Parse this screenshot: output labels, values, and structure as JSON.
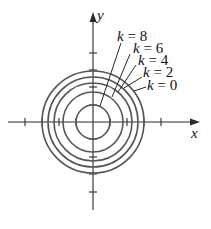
{
  "diagram": {
    "type": "level-curves",
    "origin_px": [
      93,
      122
    ],
    "unit_px": 17,
    "axes": {
      "x_label": "x",
      "y_label": "y",
      "x_ticks": [
        -4,
        -3,
        -2,
        -1,
        1,
        2,
        3,
        4
      ],
      "y_ticks": [
        -4,
        -3,
        -2,
        -1,
        1,
        2,
        3,
        4
      ]
    },
    "curves": [
      {
        "k": 8,
        "radius": 1.0
      },
      {
        "k": 6,
        "radius": 1.732
      },
      {
        "k": 4,
        "radius": 2.236
      },
      {
        "k": 2,
        "radius": 2.646
      },
      {
        "k": 0,
        "radius": 3.0
      }
    ],
    "labels": [
      {
        "var": "k",
        "eq": "=",
        "value": "8"
      },
      {
        "var": "k",
        "eq": "=",
        "value": "6"
      },
      {
        "var": "k",
        "eq": "=",
        "value": "4"
      },
      {
        "var": "k",
        "eq": "=",
        "value": "2"
      },
      {
        "var": "k",
        "eq": "=",
        "value": "0"
      }
    ],
    "colors": {
      "axis": "#2a2a2a",
      "curve": "#555555",
      "text": "#111111"
    }
  }
}
